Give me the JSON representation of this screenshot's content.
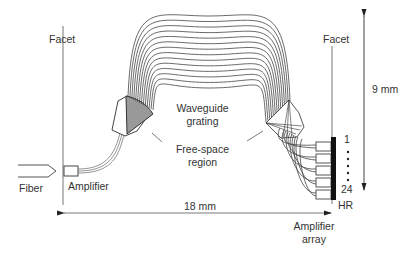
{
  "diagram": {
    "labels": {
      "facet_left": "Facet",
      "facet_right": "Facet",
      "waveguide_grating_1": "Waveguide",
      "waveguide_grating_2": "grating",
      "free_space_1": "Free-space",
      "free_space_2": "region",
      "fiber": "Fiber",
      "amplifier": "Amplifier",
      "amplifier_array_1": "Amplifier",
      "amplifier_array_2": "array",
      "hr": "HR",
      "channel_first": "1",
      "channel_last": "24",
      "dim_width": "18 mm",
      "dim_height": "9 mm"
    },
    "grating_arm_count": 14,
    "output_waveguide_count": 5,
    "colors": {
      "line": "#444444",
      "shaded_region": "#999999",
      "hr_mirror": "#111111"
    }
  }
}
